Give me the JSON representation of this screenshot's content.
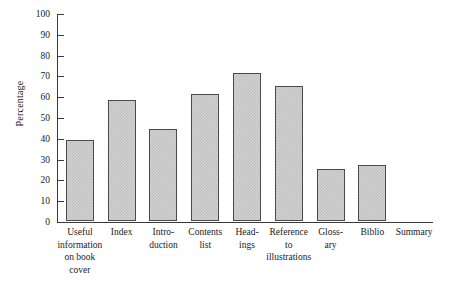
{
  "chart_data": {
    "type": "bar",
    "title": "",
    "xlabel": "",
    "ylabel": "Percentage",
    "ylim": [
      0,
      100
    ],
    "ytick_step": 10,
    "yticks": [
      0,
      10,
      20,
      30,
      40,
      50,
      60,
      70,
      80,
      90,
      100
    ],
    "ytick_labels": [
      "0",
      "10",
      "20",
      "30",
      "40",
      "50",
      "60",
      "70",
      "80",
      "90",
      "100"
    ],
    "grid": false,
    "legend": "none",
    "categories": [
      "Useful\ninformation\non book\ncover",
      "Index",
      "Intro-\nduction",
      "Contents\nlist",
      "Head-\nings",
      "Reference\nto\nillustrations",
      "Gloss-\nary",
      "Biblio",
      "Summary"
    ],
    "values": [
      39,
      58,
      44,
      61,
      71,
      65,
      25,
      27,
      0
    ],
    "bar_face_color": "#d2d2d2",
    "bar_edge_color": "#4a4a4a",
    "axis_color": "#3a3a3a",
    "background_color": "#ffffff"
  }
}
